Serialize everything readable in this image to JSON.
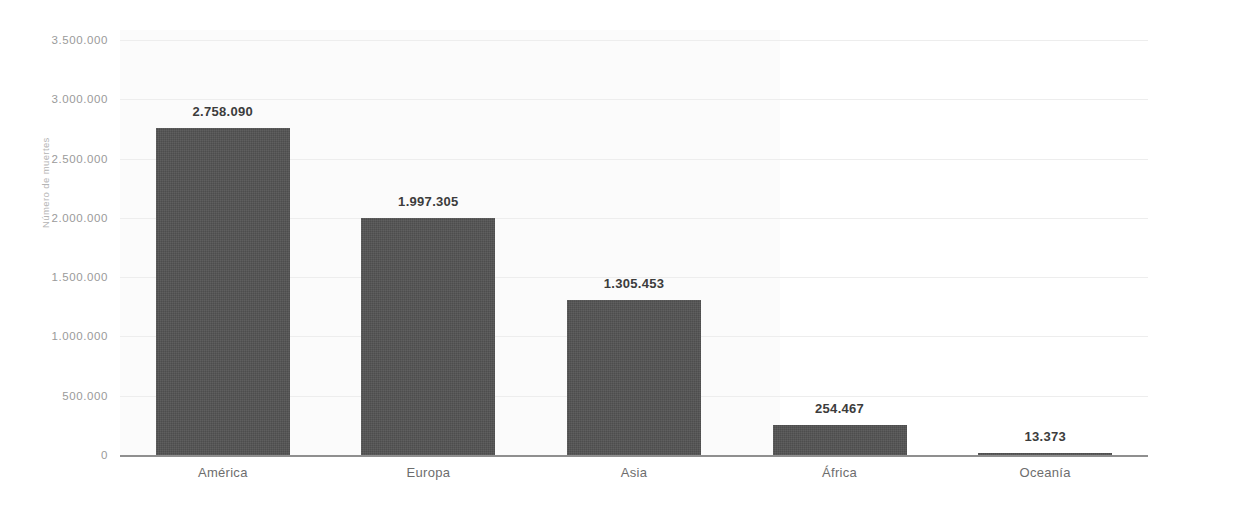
{
  "chart_data": {
    "type": "bar",
    "title": "",
    "subtitle": "",
    "xlabel": "",
    "ylabel": "Número de muertes",
    "categories": [
      "América",
      "Europa",
      "Asia",
      "África",
      "Oceanía"
    ],
    "values": [
      2758090,
      1997305,
      1305453,
      254467,
      13373
    ],
    "value_labels": [
      "2.758.090",
      "1.997.305",
      "1.305.453",
      "254.467",
      "13.373"
    ],
    "ylim": [
      0,
      3500000
    ],
    "ytick_values": [
      3500000,
      3000000,
      2500000,
      2000000,
      1500000,
      1000000,
      500000,
      0
    ],
    "ytick_labels": [
      "3.500.000",
      "3.000.000",
      "2.500.000",
      "2.000.000",
      "1.500.000",
      "1.000.000",
      "500.000",
      "0"
    ],
    "grid": true,
    "grid_axis": "y",
    "legend": false,
    "legend_position": "none",
    "bar_color": "#4d4d4d",
    "gridline_color": "#ededed",
    "axis_color": "#8f8f8f",
    "tick_label_color": "#9a9a9a",
    "value_label_color": "#3c3c3c",
    "category_label_color": "#6d6d6d"
  }
}
